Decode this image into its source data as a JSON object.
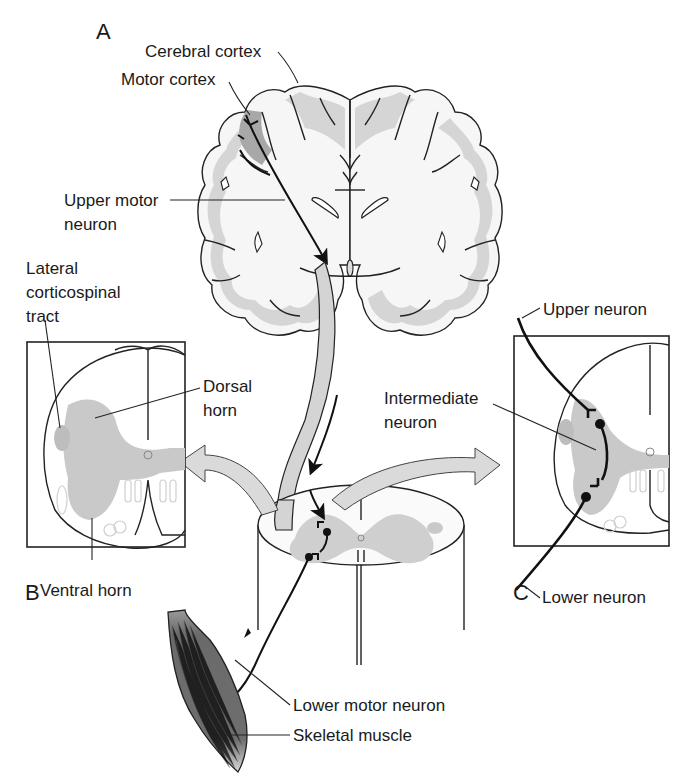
{
  "figure": {
    "panels": {
      "A": "A",
      "B": "B",
      "C": "C"
    },
    "labels": {
      "cerebral_cortex": "Cerebral cortex",
      "motor_cortex": "Motor cortex",
      "upper_motor_neuron_line1": "Upper motor",
      "upper_motor_neuron_line2": "neuron",
      "lateral_corticospinal_line1": "Lateral",
      "lateral_corticospinal_line2": "corticospinal",
      "lateral_corticospinal_line3": "tract",
      "dorsal_horn_line1": "Dorsal",
      "dorsal_horn_line2": "horn",
      "ventral_horn": "Ventral horn",
      "upper_neuron": "Upper neuron",
      "intermediate_neuron_line1": "Intermediate",
      "intermediate_neuron_line2": "neuron",
      "lower_neuron": "Lower neuron",
      "lower_motor_neuron": "Lower motor neuron",
      "skeletal_muscle": "Skeletal muscle"
    },
    "colors": {
      "gray_matter": "#c9c9c9",
      "white_matter": "#f6f6f6",
      "motor_cortex_highlight": "#a8a8a8",
      "muscle": "#6e6e6e",
      "outline": "#222222"
    }
  }
}
